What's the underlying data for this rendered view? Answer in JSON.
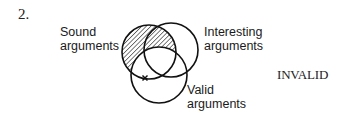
{
  "problem": {
    "number": "2.",
    "verdict": "INVALID"
  },
  "venn": {
    "sets": [
      {
        "id": "sound",
        "label_line1": "Sound",
        "label_line2": "arguments",
        "cx": 149,
        "cy": 52,
        "r": 27,
        "shaded_region": "sound-outside-valid"
      },
      {
        "id": "interesting",
        "label_line1": "Interesting",
        "label_line2": "arguments",
        "cx": 171,
        "cy": 50,
        "r": 27
      },
      {
        "id": "valid",
        "label_line1": "Valid",
        "label_line2": "arguments",
        "cx": 159,
        "cy": 75,
        "r": 28
      }
    ],
    "marker": {
      "symbol": "x",
      "x": 145,
      "y": 78,
      "region": "sound-not-interesting on valid boundary"
    },
    "colors": {
      "stroke": "#111111",
      "hatch": "#111111",
      "background": "#ffffff"
    }
  }
}
